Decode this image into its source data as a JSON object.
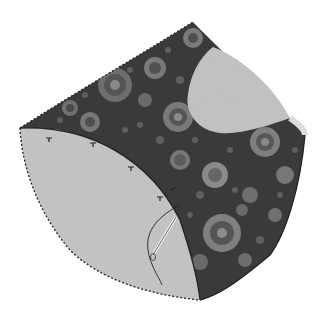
{
  "image": {
    "alt": "Illustration of a curved fabric patch with dark circle-print fabric, two light felt pieces, blanket-stitched edges, pins and a threaded needle",
    "colors": {
      "background": "#ffffff",
      "dark_fabric": "#3a3a3a",
      "felt": "#c8c8c8",
      "felt_light": "#d6d6d6",
      "stitch": "#222222",
      "circle_outer": "#7a7a7a",
      "circle_mid": "#5a5a5a",
      "circle_inner": "#8e8e8e"
    },
    "elements": {
      "dark_panel": "printed fabric panel",
      "felt_left": "large felt quarter-circle",
      "felt_top_right": "felt curved piece",
      "needle": "threaded needle",
      "pins": "pins along curved seam"
    }
  }
}
